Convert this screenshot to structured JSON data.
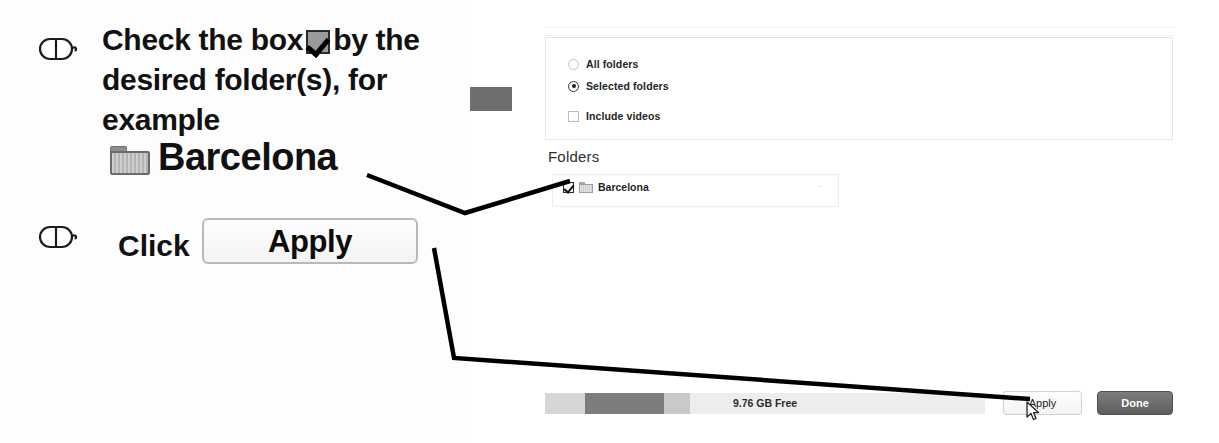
{
  "instructions": {
    "step1": {
      "icon": "mouse-click-icon",
      "text_before_checkbox": "Check the box",
      "checkbox_glyph": "checked-checkbox-icon",
      "text_after_checkbox": "by the desired folder(s), for example",
      "folder_icon": "folder-icon",
      "folder_name": "Barcelona"
    },
    "step2": {
      "icon": "mouse-click-icon",
      "label": "Click",
      "button_label": "Apply"
    }
  },
  "app": {
    "options": {
      "all_folders": "All folders",
      "selected_folders": "Selected folders",
      "include_videos": "Include videos",
      "selected_value": "Selected folders"
    },
    "folders_section": {
      "heading": "Folders",
      "items": [
        {
          "name": "Barcelona",
          "checked": true,
          "icon": "folder-icon",
          "marker": "''"
        }
      ]
    },
    "bottom_bar": {
      "capacity_label": "9.76 GB Free",
      "capacity_segments": [
        {
          "name": "segment-light",
          "width_pct": 9,
          "color": "#d6d6d6"
        },
        {
          "name": "segment-dark",
          "width_pct": 18,
          "color": "#7d7d7d"
        },
        {
          "name": "segment-medium",
          "width_pct": 6,
          "color": "#c9c9c9"
        },
        {
          "name": "segment-free",
          "width_pct": 67,
          "color": "#ededed"
        }
      ],
      "apply_label": "Apply",
      "done_label": "Done",
      "cursor": "arrow-cursor-icon"
    }
  },
  "colors": {
    "accent_dark": "#5e5e5e",
    "panel_bg": "#ffffff",
    "border": "#e6e6e6",
    "callout_line": "#000000"
  }
}
